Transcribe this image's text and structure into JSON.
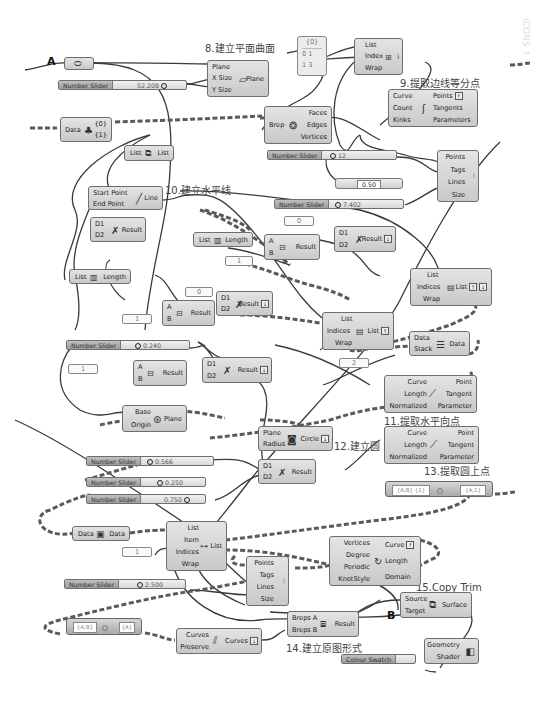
{
  "watermark": "ICONS ↑",
  "markers": {
    "a": "A",
    "b": "B"
  },
  "captions": {
    "c8": "8.建立平面曲面",
    "c9": "9.提取边线等分点",
    "c10": "10.建立水平线",
    "c11": "11.提取水平向点",
    "c12": "12.建立圆",
    "c13": "13.提取圆上点",
    "c14": "14.建立原图形式",
    "c15": "15.Copy Trim"
  },
  "sliders": [
    {
      "label": "Number Slider",
      "value": "52.208"
    },
    {
      "label": "Number Slider",
      "value": "12"
    },
    {
      "label": "Number Slider",
      "value": "7.402"
    },
    {
      "label": "Number Slider",
      "value": "0.240"
    },
    {
      "label": "Number Slider",
      "value": "0.566"
    },
    {
      "label": "Number Slider",
      "value": "0.250"
    },
    {
      "label": "Number Slider",
      "value": "0.750"
    },
    {
      "label": "Number Slider",
      "value": "2.500"
    }
  ],
  "mini_slider": {
    "value": "0.50"
  },
  "colour_swatch": {
    "label": "Colour Swatch"
  },
  "panels": {
    "p_zero_a": "0",
    "p_one_a": "1",
    "p_zero_b": "0",
    "p_one_b": "1",
    "p_one_c": "1",
    "p_two": "2",
    "p_one_d": "1"
  },
  "datagrid": {
    "header": "{0}",
    "row1": "0  1",
    "row2": "1  3"
  },
  "nodes": {
    "plane_surface": {
      "inputs": [
        "Plane",
        "X Size",
        "Y Size"
      ],
      "output": "Plane"
    },
    "list_item_top": {
      "inputs": [
        "List",
        "Index",
        "Wrap"
      ],
      "output": "i"
    },
    "divide_curve": {
      "inputs": [
        "Curve",
        "Count",
        "Kinks"
      ],
      "outputs": [
        "Points",
        "Tangents",
        "Parameters"
      ]
    },
    "deconstruct_brep": {
      "input": "Brep",
      "outputs": [
        "Faces",
        "Edges",
        "Vertices"
      ]
    },
    "data_tree": {
      "input": "Data",
      "outputs": [
        "{0}",
        "{1}"
      ]
    },
    "list_flip": {
      "input": "List",
      "output": "List"
    },
    "point_list": {
      "inputs": [
        "Points",
        "Tags",
        "Lines",
        "Size"
      ]
    },
    "line": {
      "inputs": [
        "Start Point",
        "End Point"
      ],
      "output": "Line"
    },
    "dist1": {
      "inputs": [
        "D1",
        "D2"
      ],
      "output": "Result"
    },
    "list_length1": {
      "input": "List",
      "output": "Length"
    },
    "sub1": {
      "inputs": [
        "A",
        "B"
      ],
      "output": "Result"
    },
    "dist2": {
      "inputs": [
        "D1",
        "D2"
      ],
      "output": "Result"
    },
    "list_length2": {
      "input": "List",
      "output": "Length"
    },
    "list_item_right": {
      "inputs": [
        "List",
        "Indices",
        "Wrap"
      ],
      "output": "List"
    },
    "dist3": {
      "inputs": [
        "D1",
        "D2"
      ],
      "output": "Result"
    },
    "sub2": {
      "inputs": [
        "A",
        "B"
      ],
      "output": "Result"
    },
    "list_item_mid": {
      "inputs": [
        "List",
        "Indices",
        "Wrap"
      ],
      "output": "List"
    },
    "stack_data": {
      "inputs": [
        "Data",
        "Stack"
      ],
      "output": "Data"
    },
    "dist4": {
      "inputs": [
        "D1",
        "D2"
      ],
      "output": "Result"
    },
    "sub3": {
      "inputs": [
        "A",
        "B"
      ],
      "output": "Result"
    },
    "eval_len1": {
      "inputs": [
        "Curve",
        "Length",
        "Normalized"
      ],
      "outputs": [
        "Point",
        "Tangent",
        "Parameter"
      ]
    },
    "plane_origin": {
      "inputs": [
        "Base",
        "Origin"
      ],
      "output": "Plane"
    },
    "circle": {
      "inputs": [
        "Plane",
        "Radius"
      ],
      "output": "Circle"
    },
    "eval_len2": {
      "inputs": [
        "Curve",
        "Length",
        "Normalized"
      ],
      "outputs": [
        "Point",
        "Tangent",
        "Parameter"
      ]
    },
    "dist5": {
      "inputs": [
        "D1",
        "D2"
      ],
      "output": "Result"
    },
    "data_param": {
      "input": "Data",
      "output": "Data"
    },
    "list_item_bottom": {
      "inputs": [
        "List",
        "Item",
        "Indices",
        "Wrap"
      ],
      "output": "List"
    },
    "point_list2": {
      "inputs": [
        "Points",
        "Tags",
        "Lines",
        "Size"
      ]
    },
    "interp_curve": {
      "inputs": [
        "Vertices",
        "Degree",
        "Periodic",
        "KnotStyle"
      ],
      "outputs": [
        "Curve",
        "Length",
        "Domain"
      ]
    },
    "join_curves": {
      "inputs": [
        "Curves",
        "Preserve"
      ],
      "output": "Curves"
    },
    "boolean_union": {
      "inputs": [
        "Breps A",
        "Breps B"
      ],
      "output": "Result"
    },
    "copy_trim": {
      "inputs": [
        "Source",
        "Target"
      ],
      "output": "Surface"
    },
    "custom_preview": {
      "inputs": [
        "Geometry",
        "Shader"
      ]
    }
  },
  "toggles": {
    "t13": {
      "left": "{A;B} {1}",
      "right": "{A;1}"
    },
    "t14": {
      "left": "{A;B}",
      "right": "{A}"
    }
  }
}
